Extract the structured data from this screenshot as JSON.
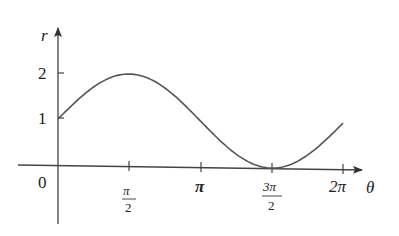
{
  "chart_data": {
    "type": "line",
    "title": "",
    "function": "r = 1 + sin(theta)",
    "xlabel": "θ",
    "ylabel": "r",
    "x_ticks": [
      "π/2",
      "π",
      "3π/2",
      "2π"
    ],
    "x_tick_values": [
      1.5708,
      3.1416,
      4.7124,
      6.2832
    ],
    "y_ticks": [
      "0",
      "1",
      "2"
    ],
    "y_tick_values": [
      0,
      1,
      2
    ],
    "xlim": [
      -0.9,
      7.2
    ],
    "ylim": [
      -1.0,
      2.5
    ],
    "grid": false,
    "series": [
      {
        "name": "r = 1 + sin θ",
        "x": [
          0,
          0.785,
          1.571,
          2.356,
          3.142,
          3.927,
          4.712,
          5.498,
          6.283
        ],
        "values": [
          1,
          1.71,
          2,
          1.71,
          1,
          0.29,
          0,
          0.29,
          1
        ]
      }
    ]
  },
  "labels": {
    "r": "r",
    "theta": "θ",
    "zero": "0",
    "one": "1",
    "two": "2",
    "pi": "π",
    "two_pi": "2π",
    "pi_num": "π",
    "three_pi_num": "3π",
    "den": "2"
  }
}
